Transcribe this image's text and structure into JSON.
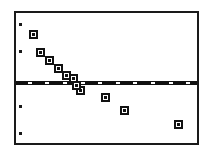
{
  "figure": {
    "name": "residual-scatter-plot",
    "width": 211,
    "height": 151,
    "background": "#ffffff",
    "frame_color": "#1a1a1a",
    "marker_color": "#111111",
    "line_color": "#111111"
  },
  "chart_data": {
    "type": "scatter",
    "title": "",
    "subtitle": "",
    "xlabel": "",
    "ylabel": "",
    "xlim": [
      0,
      185
    ],
    "ylim": [
      0,
      134
    ],
    "grid": false,
    "legend": null,
    "annotations": [],
    "series": [
      {
        "name": "observations",
        "marker": "open-square",
        "points": [
          {
            "x": 18,
            "y": 112
          },
          {
            "x": 25,
            "y": 93
          },
          {
            "x": 34,
            "y": 85
          },
          {
            "x": 43,
            "y": 77
          },
          {
            "x": 52,
            "y": 70
          },
          {
            "x": 59,
            "y": 67
          },
          {
            "x": 62,
            "y": 59
          },
          {
            "x": 66,
            "y": 54
          },
          {
            "x": 91,
            "y": 47
          },
          {
            "x": 111,
            "y": 34
          },
          {
            "x": 166,
            "y": 19
          }
        ]
      }
    ],
    "reference_line": {
      "name": "horizontal-reference-line",
      "orientation": "horizontal",
      "y": 64,
      "x_start": 0,
      "x_end": 185,
      "thickness": 4,
      "style": "solid-with-tick-breaks"
    },
    "y_ticks": [
      11,
      39,
      96,
      124
    ],
    "x_tick_breaks": [
      12,
      30,
      48,
      66,
      84,
      102,
      120,
      138,
      156,
      174
    ]
  }
}
